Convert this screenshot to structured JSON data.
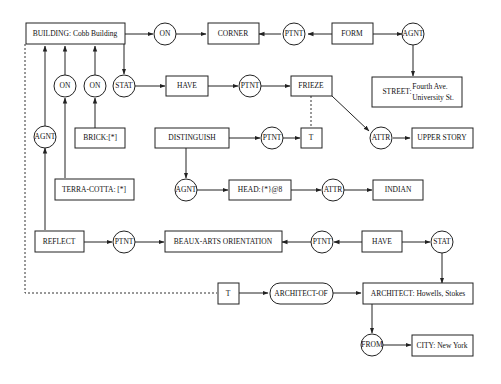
{
  "diagram": {
    "type": "conceptual-graph",
    "concepts": {
      "building": {
        "label": "BUILDING: Cobb Building"
      },
      "corner": {
        "label": "CORNER"
      },
      "form": {
        "label": "FORM"
      },
      "street_label": {
        "label": "STREET:"
      },
      "street_value_1": {
        "label": "Fourth Ave."
      },
      "street_value_2": {
        "label": "University St."
      },
      "have1": {
        "label": "HAVE"
      },
      "frieze": {
        "label": "FRIEZE"
      },
      "brick": {
        "label": "BRICK:[*]"
      },
      "distinguish": {
        "label": "DISTINGUISH"
      },
      "t1": {
        "label": "T"
      },
      "upper_story": {
        "label": "UPPER STORY"
      },
      "terra_cotta": {
        "label": "TERRA-COTTA: [*]"
      },
      "head": {
        "label": "HEAD:{*}@8"
      },
      "indian": {
        "label": "INDIAN"
      },
      "reflect": {
        "label": "REFLECT"
      },
      "beaux_arts": {
        "label": "BEAUX-ARTS ORIENTATION"
      },
      "have2": {
        "label": "HAVE"
      },
      "t2": {
        "label": "T"
      },
      "architect_of": {
        "label": "ARCHITECT-OF"
      },
      "architect": {
        "label": "ARCHITECT: Howells, Stokes"
      },
      "city": {
        "label": "CITY: New York"
      }
    },
    "relations": {
      "on1": {
        "label": "ON"
      },
      "ptnt1": {
        "label": "PTNT"
      },
      "agnt1": {
        "label": "AGNT"
      },
      "on2": {
        "label": "ON"
      },
      "on3": {
        "label": "ON"
      },
      "stat1": {
        "label": "STAT"
      },
      "ptnt2": {
        "label": "PTNT"
      },
      "agnt2": {
        "label": "AGNT"
      },
      "ptnt3": {
        "label": "PTNT"
      },
      "attr1": {
        "label": "ATTR"
      },
      "agnt3": {
        "label": "AGNT"
      },
      "attr2": {
        "label": "ATTR"
      },
      "ptnt4": {
        "label": "PTNT"
      },
      "ptnt5": {
        "label": "PTNT"
      },
      "stat2": {
        "label": "STAT"
      },
      "from": {
        "label": "FROM"
      }
    }
  }
}
